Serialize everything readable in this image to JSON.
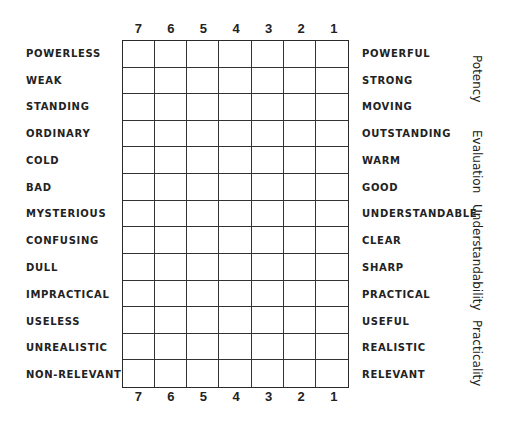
{
  "scale": {
    "top_numbers": [
      "7",
      "6",
      "5",
      "4",
      "3",
      "2",
      "1"
    ],
    "bottom_numbers": [
      "7",
      "6",
      "5",
      "4",
      "3",
      "2",
      "1"
    ]
  },
  "left_adjectives": [
    "POWERLESS",
    "WEAK",
    "STANDING",
    "ORDINARY",
    "COLD",
    "BAD",
    "MYSTERIOUS",
    "CONFUSING",
    "DULL",
    "IMPRACTICAL",
    "USELESS",
    "UNREALISTIC",
    "NON-RELEVANT"
  ],
  "right_adjectives": [
    "POWERFUL",
    "STRONG",
    "MOVING",
    "OUTSTANDING",
    "WARM",
    "GOOD",
    "UNDERSTANDABLE",
    "CLEAR",
    "SHARP",
    "PRACTICAL",
    "USEFUL",
    "REALISTIC",
    "RELEVANT"
  ],
  "factors": [
    {
      "label": "Potency",
      "top": 55
    },
    {
      "label": "Evaluation",
      "top": 130
    },
    {
      "label": "Understandability",
      "top": 204
    },
    {
      "label": "Practicality",
      "top": 320
    }
  ],
  "grid": {
    "columns": 7,
    "rows": 13,
    "line_color": "#2a2a2a"
  }
}
